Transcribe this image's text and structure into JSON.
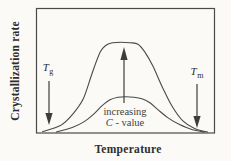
{
  "figure": {
    "background_color": "#fbfaf6",
    "line_color": "#4a4a4a",
    "arrow_color": "#3d3d3d",
    "text_color": "#2e2e2e",
    "annotation_text_color": "#3f3f3f"
  },
  "labels": {
    "y_axis": "Crystallization rate",
    "x_axis": "Temperature",
    "glass_transition": {
      "symbol": "T",
      "subscript": "g"
    },
    "melting": {
      "symbol": "T",
      "subscript": "m"
    },
    "annotation_line1": "increasing",
    "annotation_c_symbol": "C",
    "annotation_line2_rest": " - value"
  },
  "chart_data": {
    "type": "line",
    "title": "",
    "xlabel": "Temperature",
    "ylabel": "Crystallization rate",
    "x_axis_numeric": false,
    "y_axis_numeric": false,
    "grid": false,
    "legend": false,
    "axis_markers": [
      {
        "label": "Tg",
        "marker": "downward arrow",
        "position": "left, near onset of curves"
      },
      {
        "label": "Tm",
        "marker": "downward arrow",
        "position": "right, near end of curves"
      }
    ],
    "annotations": [
      {
        "text": "increasing C - value",
        "marker": "upward arrow from lower curve toward upper curve peak"
      }
    ],
    "value_units": "normalized 0-100 estimates (qualitative sketch; no numeric ticks shown)",
    "series": [
      {
        "name": "higher C-value",
        "points": [
          [
            3.4,
            0.8
          ],
          [
            13.4,
            5.6
          ],
          [
            20.1,
            14.4
          ],
          [
            26.3,
            27.2
          ],
          [
            31.3,
            48.0
          ],
          [
            35.8,
            64.8
          ],
          [
            39.1,
            70.4
          ],
          [
            43.0,
            72.4
          ],
          [
            47.5,
            72.8
          ],
          [
            52.5,
            72.4
          ],
          [
            57.0,
            71.2
          ],
          [
            60.9,
            64.8
          ],
          [
            65.4,
            53.6
          ],
          [
            70.4,
            37.6
          ],
          [
            76.0,
            21.6
          ],
          [
            82.1,
            9.6
          ],
          [
            88.8,
            3.2
          ],
          [
            96.1,
            0.4
          ]
        ]
      },
      {
        "name": "lower C-value",
        "points": [
          [
            11.2,
            0.4
          ],
          [
            20.1,
            4.0
          ],
          [
            26.8,
            8.8
          ],
          [
            32.4,
            15.2
          ],
          [
            36.9,
            21.6
          ],
          [
            41.3,
            26.4
          ],
          [
            45.8,
            28.4
          ],
          [
            50.3,
            28.8
          ],
          [
            54.7,
            28.4
          ],
          [
            59.2,
            27.2
          ],
          [
            63.7,
            24.0
          ],
          [
            68.2,
            18.4
          ],
          [
            73.7,
            12.0
          ],
          [
            80.4,
            6.4
          ],
          [
            87.2,
            2.4
          ],
          [
            94.4,
            0.4
          ]
        ]
      }
    ]
  }
}
